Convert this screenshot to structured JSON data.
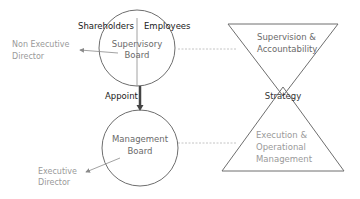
{
  "diagram": {
    "supervisory_board": {
      "line1": "Supervisory",
      "line2": "Board",
      "left_label": "Shareholders",
      "right_label": "Employees"
    },
    "appoint_label": "Appoint",
    "management_board": {
      "line1": "Management",
      "line2": "Board"
    },
    "non_executive_director": {
      "line1": "Non Executive",
      "line2": "Director"
    },
    "executive_director": {
      "line1": "Executive",
      "line2": "Director"
    },
    "top_triangle": {
      "line1": "Supervision &",
      "line2": "Accountability"
    },
    "bottom_triangle": {
      "line1": "Execution &",
      "line2": "Operational",
      "line3": "Management"
    },
    "overlap_label": "Strategy",
    "colors": {
      "stroke": "#6e6e6e",
      "dark_text": "#1a1a1a",
      "grey_text": "#8a8a8a",
      "dashed": "#b5b5b5",
      "arrow": "#444444"
    }
  }
}
